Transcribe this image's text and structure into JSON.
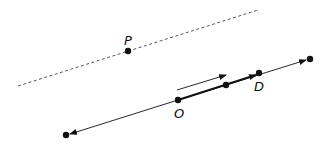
{
  "diagram": {
    "colors": {
      "stroke": "#111111",
      "dashed": "#555555",
      "background": "#ffffff"
    },
    "labels": {
      "P": "P",
      "O": "O",
      "D": "D"
    },
    "points": [
      {
        "id": "P",
        "label": "P",
        "x": 128,
        "y": 51
      },
      {
        "id": "O",
        "label": "O",
        "x": 178,
        "y": 100
      },
      {
        "id": "mid",
        "label": "",
        "x": 226,
        "y": 85
      },
      {
        "id": "D",
        "label": "D",
        "x": 259,
        "y": 73
      },
      {
        "id": "end-left",
        "label": "",
        "x": 66,
        "y": 135
      },
      {
        "id": "end-right",
        "label": "",
        "x": 310,
        "y": 59
      }
    ],
    "lines": [
      {
        "id": "dashed-line-through-P",
        "style": "dashed",
        "from": [
          18,
          86
        ],
        "to": [
          258,
          10
        ]
      },
      {
        "id": "line-through-O",
        "style": "solid",
        "from": [
          66,
          135
        ],
        "to": [
          310,
          59
        ],
        "arrows": "both"
      },
      {
        "id": "vector-OD",
        "style": "bold",
        "from": [
          178,
          100
        ],
        "to": [
          259,
          73
        ],
        "arrows": "end"
      },
      {
        "id": "direction-arrow",
        "style": "solid",
        "from": [
          177,
          90
        ],
        "to": [
          226,
          75
        ],
        "arrows": "end"
      }
    ]
  }
}
